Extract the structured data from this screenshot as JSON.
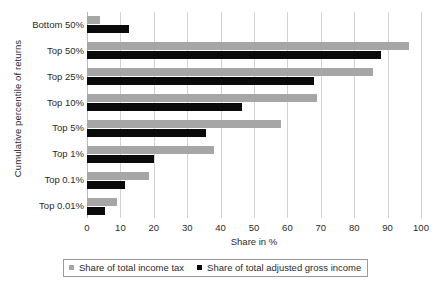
{
  "chart_data": {
    "type": "bar",
    "orientation": "horizontal",
    "title": "",
    "xlabel": "Share in %",
    "ylabel": "Cumulative percentile of returns",
    "categories": [
      "Bottom 50%",
      "Top 50%",
      "Top 25%",
      "Top 10%",
      "Top 5%",
      "Top 1%",
      "Top 0.1%",
      "Top 0.01%"
    ],
    "series": [
      {
        "name": "Share of total income tax",
        "color": "#a6a6a6",
        "values": [
          4,
          96.5,
          85.5,
          69,
          58,
          38,
          18.5,
          9
        ]
      },
      {
        "name": "Share of total adjusted gross income",
        "color": "#0a0a0a",
        "values": [
          12.5,
          88,
          68,
          46.5,
          35.5,
          20,
          11.5,
          5.5
        ]
      }
    ],
    "xlim": [
      0,
      100
    ],
    "xticks": [
      0,
      10,
      20,
      30,
      40,
      50,
      60,
      70,
      80,
      90,
      100
    ],
    "xtick_labels": [
      "0",
      "10",
      "20",
      "30",
      "40",
      "50",
      "60",
      "70",
      "80",
      "90",
      "100"
    ],
    "grid": "vertical",
    "legend_position": "bottom"
  },
  "legend": {
    "items": [
      {
        "label": "Share of total income tax"
      },
      {
        "label": "Share of total adjusted gross income"
      }
    ]
  }
}
